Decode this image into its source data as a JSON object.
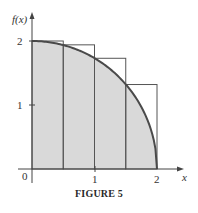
{
  "chart_data": {
    "type": "area",
    "title": "",
    "caption": "FIGURE 5",
    "xlabel": "x",
    "ylabel": "f(x)",
    "xlim": [
      0,
      2
    ],
    "ylim": [
      0,
      2
    ],
    "x_ticks": [
      "0",
      "1",
      "2"
    ],
    "y_ticks": [
      "1",
      "2"
    ],
    "grid": false,
    "curve": {
      "name": "f(x) = sqrt(4 - x^2)",
      "x": [
        0,
        0.25,
        0.5,
        0.75,
        1.0,
        1.25,
        1.5,
        1.75,
        1.9,
        2.0
      ],
      "y": [
        2.0,
        1.98,
        1.94,
        1.85,
        1.73,
        1.56,
        1.32,
        0.97,
        0.62,
        0.0
      ]
    },
    "rectangles": {
      "description": "Upper sum rectangles (left endpoints), n = 4",
      "x_left": [
        0,
        0.5,
        1.0,
        1.5
      ],
      "width": 0.5,
      "heights": [
        2.0,
        1.94,
        1.73,
        1.32
      ]
    },
    "colors": {
      "fill": "#d9d9d9",
      "curve": "#4a4a4a",
      "rect_stroke": "#555555",
      "axis": "#444444"
    }
  },
  "labels": {
    "y_axis": "f(x)",
    "x_axis": "x",
    "origin": "0",
    "tick_x1": "1",
    "tick_x2": "2",
    "tick_y1": "1",
    "tick_y2": "2",
    "caption": "FIGURE 5"
  }
}
